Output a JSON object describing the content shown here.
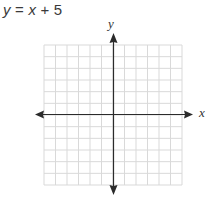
{
  "problem": {
    "equation": "y = x + 5",
    "equation_parts": {
      "lhs_var": "y",
      "op1": " = ",
      "rhs_var": "x",
      "op2": " + ",
      "const": "5"
    }
  },
  "colors": {
    "grid": "#d9d9d9",
    "axis": "#2b2b2b",
    "text": "#3a3a3a"
  },
  "chart_data": {
    "type": "line",
    "title": "y = x + 5",
    "xlabel": "x",
    "ylabel": "y",
    "grid": true,
    "grid_cells_x": 12,
    "grid_cells_y": 12,
    "xlim": [
      -6,
      6
    ],
    "ylim": [
      -6,
      6
    ],
    "tick_labels": [],
    "series": []
  }
}
